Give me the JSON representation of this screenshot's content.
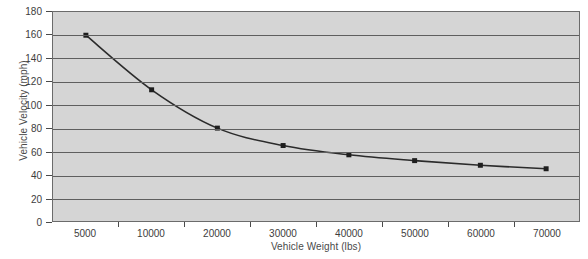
{
  "chart_data": {
    "type": "line",
    "title": "",
    "xlabel": "Vehicle Weight (lbs)",
    "ylabel": "Vehicle Velocity (mph)",
    "categories": [
      "5000",
      "10000",
      "20000",
      "30000",
      "40000",
      "50000",
      "60000",
      "70000"
    ],
    "values": [
      160,
      113,
      80,
      65,
      57,
      52,
      48,
      45
    ],
    "series": [
      {
        "name": "Vehicle Velocity",
        "values": [
          160,
          113,
          80,
          65,
          57,
          52,
          48,
          45
        ]
      }
    ],
    "ylim": [
      0,
      180
    ],
    "ytick_values": [
      0,
      20,
      40,
      60,
      80,
      100,
      120,
      140,
      160,
      180
    ],
    "ytick_labels": [
      "0",
      "20",
      "40",
      "60",
      "80",
      "100",
      "120",
      "140",
      "160",
      "180"
    ],
    "grid": "horizontal",
    "legend": "none",
    "marker": "square",
    "colors": {
      "plot_background": "#d5d5d5",
      "gridline": "#5f5f5f",
      "line": "#2b2b2b",
      "marker": "#1e1e1e",
      "axis": "#6b6b6b",
      "text": "#3d3d3d",
      "page_background": "#ffffff"
    }
  }
}
